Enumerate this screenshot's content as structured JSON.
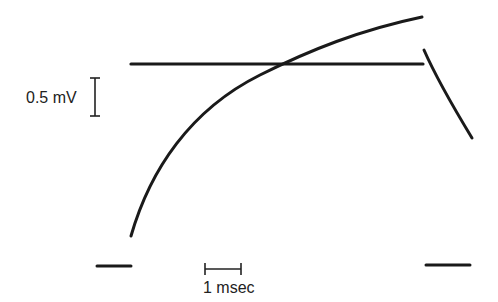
{
  "figure": {
    "voltage_scale_label": "0.5 mV",
    "time_scale_label": "1 msec",
    "ink_color": "#1a1a1a",
    "background": "#ffffff"
  },
  "traces": [
    {
      "name": "threshold-line",
      "description": "horizontal reference level"
    },
    {
      "name": "rising-potential",
      "description": "exponentially rising curve crossing threshold"
    },
    {
      "name": "decaying-potential",
      "description": "falling segment after reset"
    },
    {
      "name": "baseline-left",
      "description": "baseline marker left"
    },
    {
      "name": "baseline-right",
      "description": "baseline marker right"
    }
  ]
}
